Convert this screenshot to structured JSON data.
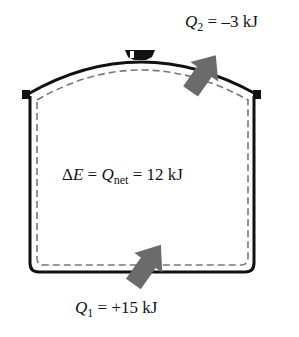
{
  "diagram": {
    "container": {
      "shape": "pot-with-lid",
      "outline_color": "#111111",
      "boundary_style": "dashed",
      "boundary_color": "#777777"
    },
    "q2": {
      "symbol": "Q",
      "subscript": "2",
      "equals": "=",
      "value": "–3 kJ",
      "arrow_direction": "out"
    },
    "center": {
      "delta": "Δ",
      "E": "E",
      "eq1": "=",
      "Q": "Q",
      "subscript": "net",
      "eq2": "=",
      "value": "12 kJ"
    },
    "q1": {
      "symbol": "Q",
      "subscript": "1",
      "equals": "=",
      "value": "+15 kJ",
      "arrow_direction": "in"
    },
    "arrow_color": "#6b6b6b"
  }
}
